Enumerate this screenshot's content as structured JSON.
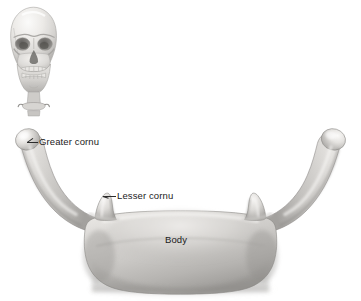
{
  "figure": {
    "background_color": "#ffffff",
    "width": 361,
    "height": 301
  },
  "inset": {
    "name": "skull-orientation-inset",
    "description": "Small grayscale frontal-view human skull with mandible and upper cervical/hyoid region shown below it, used as an orientation key",
    "bounds": {
      "x": 8,
      "y": 6,
      "width": 52,
      "height": 112
    }
  },
  "specimen": {
    "name": "hyoid-bone",
    "description": "U-shaped hyoid bone seen from the front, rendered in grayscale airbrush shading",
    "bounds": {
      "x": 10,
      "y": 128,
      "width": 341,
      "height": 165
    }
  },
  "labels": [
    {
      "id": "greater-cornu",
      "text": "Greater cornu",
      "x": 39,
      "y": 136,
      "leader": true,
      "points_to": "left greater horn tip"
    },
    {
      "id": "lesser-cornu",
      "text": "Lesser cornu",
      "x": 117,
      "y": 190,
      "leader": true,
      "points_to": "left lesser horn"
    },
    {
      "id": "body",
      "text": "Body",
      "x": 165,
      "y": 234,
      "leader": false,
      "points_to": "central body of hyoid"
    }
  ],
  "colors": {
    "background": "#ffffff",
    "label_text": "#1b1b1b",
    "leader_line": "#2b2b2b",
    "bone_highlight": "#f2f1ef",
    "bone_light": "#dedcd9",
    "bone_mid": "#c3c1be",
    "bone_shadow": "#9a9895",
    "bone_deep_shadow": "#7c7a77",
    "bone_outline": "#6e6c69",
    "cast_shadow": "#d9d7d4"
  }
}
